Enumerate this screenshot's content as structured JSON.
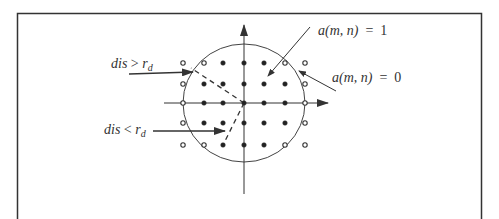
{
  "figure": {
    "border_color": "#333333",
    "line_color": "#333333",
    "grid": {
      "columns_x": [
        183,
        204,
        223,
        244,
        264,
        285,
        305
      ],
      "rows_y": [
        63,
        84,
        103,
        123,
        145
      ],
      "pattern": [
        [
          0,
          0,
          1,
          1,
          1,
          0,
          0
        ],
        [
          0,
          1,
          1,
          1,
          1,
          1,
          0
        ],
        [
          0,
          1,
          1,
          1,
          1,
          1,
          0
        ],
        [
          0,
          1,
          1,
          1,
          1,
          1,
          0
        ],
        [
          0,
          0,
          1,
          1,
          1,
          0,
          0
        ]
      ],
      "legend": {
        "1": "filled dot (inside)",
        "0": "hollow dot (outside)"
      }
    },
    "circle": {
      "cx": 244,
      "cy": 103,
      "rx": 61,
      "ry": 59
    },
    "axes": {
      "origin": [
        244,
        103
      ],
      "x_axis": {
        "from": 164,
        "to": 328
      },
      "y_axis": {
        "from": 194,
        "to": 25
      }
    },
    "labels": {
      "dis_greater": {
        "var": "dis",
        "op": ">",
        "sym": "r",
        "sub": "d"
      },
      "dis_less": {
        "var": "dis",
        "op": "<",
        "sym": "r",
        "sub": "d"
      },
      "a_one": {
        "func": "a",
        "args": "(m, n)",
        "eq": "=",
        "value": "1"
      },
      "a_zero": {
        "func": "a",
        "args": "(m, n)",
        "eq": "=",
        "value": "0"
      }
    }
  }
}
